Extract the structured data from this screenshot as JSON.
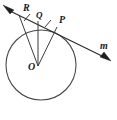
{
  "figure": {
    "type": "geometry-diagram",
    "background_color": "#ffffff",
    "stroke_color": "#4a4a4a",
    "label_color": "#1a1a1a"
  },
  "circle": {
    "label": "circle-O",
    "center_x": 41,
    "center_y": 65,
    "radius": 35
  },
  "center_point": {
    "label": "O",
    "x": 38,
    "y": 66,
    "label_x": 29,
    "label_y": 69
  },
  "line_m": {
    "label": "m",
    "label_x": 101,
    "label_y": 48,
    "start_x": 6,
    "start_y": 9,
    "end_x": 108,
    "end_y": 59,
    "arrow_start": "up-left-arrowhead",
    "arrow_end": "down-right-arrowhead"
  },
  "points": [
    {
      "label": "R",
      "x": 19,
      "y": 15,
      "label_x": 23,
      "label_y": 11
    },
    {
      "label": "Q",
      "x": 38,
      "y": 21,
      "label_x": 36,
      "label_y": 17
    },
    {
      "label": "P",
      "x": 57,
      "y": 27,
      "label_x": 59,
      "label_y": 22
    }
  ],
  "segments": [
    {
      "name": "OR",
      "from": "O",
      "to": "R"
    },
    {
      "name": "OQ",
      "from": "O",
      "to": "Q"
    },
    {
      "name": "OP",
      "from": "O",
      "to": "P"
    }
  ],
  "tick_marks": [
    {
      "name": "tick-RQ",
      "x": 27,
      "y": 18
    },
    {
      "name": "tick-QP",
      "x": 48,
      "y": 24
    }
  ],
  "icons": {
    "arrow_left": "arrow-up-left-icon",
    "arrow_right": "arrow-down-right-icon"
  }
}
